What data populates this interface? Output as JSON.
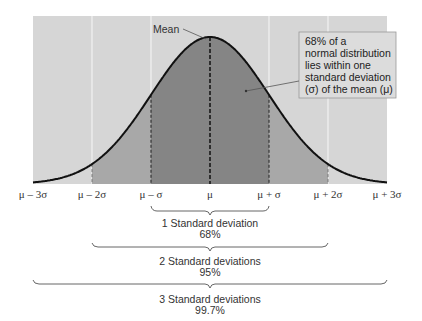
{
  "mean_label": "Mean",
  "callout": {
    "lines": [
      "68% of a",
      "normal distribution",
      "lies within one",
      "standard deviation",
      "(σ) of the mean (μ)"
    ]
  },
  "axis_ticks": [
    "μ – 3σ",
    "μ – 2σ",
    "μ – σ",
    "μ",
    "μ + σ",
    "μ + 2σ",
    "μ + 3σ"
  ],
  "brackets": [
    {
      "label": "1 Standard deviation",
      "value": "68%"
    },
    {
      "label": "2 Standard deviations",
      "value": "95%"
    },
    {
      "label": "3 Standard deviations",
      "value": "99.7%"
    }
  ],
  "colors": {
    "background_band": "#d6d6d6",
    "band_2sigma": "#a8a8a8",
    "band_1sigma": "#858585",
    "curve": "#111111",
    "callout_bg": "#dcdcdc"
  },
  "chart_data": {
    "type": "area",
    "title": "",
    "x": [
      -3,
      -2,
      -1,
      0,
      1,
      2,
      3
    ],
    "tick_labels": [
      "μ – 3σ",
      "μ – 2σ",
      "μ – σ",
      "μ",
      "μ + σ",
      "μ + 2σ",
      "μ + 3σ"
    ],
    "regions": [
      {
        "range": [
          -1,
          1
        ],
        "percent": 68
      },
      {
        "range": [
          -2,
          2
        ],
        "percent": 95
      },
      {
        "range": [
          -3,
          3
        ],
        "percent": 99.7
      }
    ],
    "annotations": [
      "Mean",
      "68% of a normal distribution lies within one standard deviation (σ) of the mean (μ)"
    ]
  }
}
